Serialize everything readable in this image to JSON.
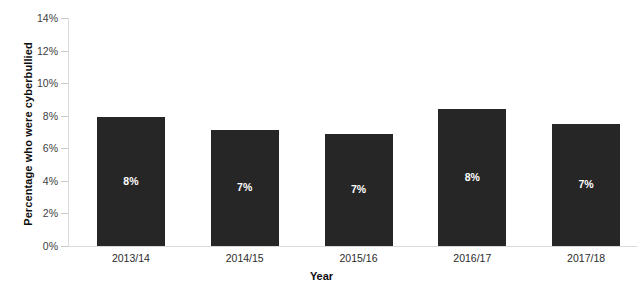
{
  "chart_data": {
    "type": "bar",
    "title": "",
    "xlabel": "Year",
    "ylabel": "Percentage who were cyberbullied",
    "categories": [
      "2013/14",
      "2014/15",
      "2015/16",
      "2016/17",
      "2017/18"
    ],
    "values": [
      7.9,
      7.1,
      6.9,
      8.4,
      7.5
    ],
    "data_labels": [
      "8%",
      "7%",
      "7%",
      "8%",
      "7%"
    ],
    "ylim": [
      0,
      14
    ],
    "ytick_values": [
      0,
      2,
      4,
      6,
      8,
      10,
      12,
      14
    ],
    "ytick_labels": [
      "0%",
      "2%",
      "4%",
      "6%",
      "8%",
      "10%",
      "12%",
      "14%"
    ],
    "grid": false,
    "legend": false,
    "bar_color": "#262626",
    "data_label_color": "#ffffff",
    "axis_color": "#d9d9d9",
    "tick_label_color": "#404040",
    "background_color": "#ffffff"
  }
}
